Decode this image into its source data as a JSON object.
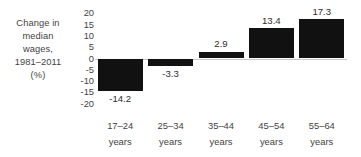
{
  "chart_data": {
    "type": "bar",
    "title": "",
    "subtitle": "",
    "xlabel": "",
    "ylabel": "Change in median wages, 1981–2011 (%)",
    "ylabel_lines": [
      "Change in",
      "median",
      "wages,",
      "1981–2011",
      "(%)"
    ],
    "categories": [
      "17–24 years",
      "25–34 years",
      "35–44 years",
      "45–54 years",
      "55–64 years"
    ],
    "category_lines": [
      {
        "range": "17–24",
        "unit": "years"
      },
      {
        "range": "25–34",
        "unit": "years"
      },
      {
        "range": "35–44",
        "unit": "years"
      },
      {
        "range": "45–54",
        "unit": "years"
      },
      {
        "range": "55–64",
        "unit": "years"
      }
    ],
    "values": [
      -14.2,
      -3.3,
      2.9,
      13.4,
      17.3
    ],
    "value_labels": [
      "-14.2",
      "-3.3",
      "2.9",
      "13.4",
      "17.3"
    ],
    "ylim": [
      -20,
      20
    ],
    "ytick_values": [
      20,
      15,
      10,
      5,
      0,
      -5,
      -10,
      -15,
      -20
    ],
    "ytick_labels": [
      "20",
      "15",
      "10",
      "5",
      "0",
      "-5",
      "-10",
      "-15",
      "-20"
    ],
    "grid": false,
    "legend": false,
    "legend_position": "none",
    "bar_color": "#111111",
    "axis_line_color": "#c9c9c9",
    "text_color": "#3f3f3f",
    "background_color": "#ffffff"
  }
}
